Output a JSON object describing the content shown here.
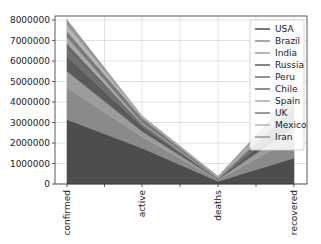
{
  "chart_data": {
    "type": "area",
    "stacked": true,
    "title": "",
    "xlabel": "",
    "ylabel": "",
    "categories": [
      "confirmed",
      "active",
      "deaths",
      "recovered"
    ],
    "ylim": [
      0,
      8300000
    ],
    "yticks": [
      0,
      1000000,
      2000000,
      3000000,
      4000000,
      5000000,
      6000000,
      7000000,
      8000000
    ],
    "ytick_labels": [
      "0",
      "1000000",
      "2000000",
      "3000000",
      "4000000",
      "5000000",
      "6000000",
      "7000000",
      "8000000"
    ],
    "grid": true,
    "legend_position": "upper right",
    "series": [
      {
        "name": "USA",
        "values": [
          3150000,
          1750000,
          134000,
          1270000
        ],
        "color": "#4d4d4d"
      },
      {
        "name": "Brazil",
        "values": [
          1550000,
          550000,
          64000,
          990000
        ],
        "color": "#8a8a8a"
      },
      {
        "name": "India",
        "values": [
          800000,
          270000,
          22000,
          500000
        ],
        "color": "#9c9c9c"
      },
      {
        "name": "Russia",
        "values": [
          720000,
          230000,
          11000,
          500000
        ],
        "color": "#5a5a5a"
      },
      {
        "name": "Peru",
        "values": [
          330000,
          110000,
          12000,
          220000
        ],
        "color": "#6e6e6e"
      },
      {
        "name": "Chile",
        "values": [
          310000,
          20000,
          7000,
          280000
        ],
        "color": "#666666"
      },
      {
        "name": "Spain",
        "values": [
          300000,
          60000,
          28000,
          190000
        ],
        "color": "#a8a8a8"
      },
      {
        "name": "UK",
        "values": [
          290000,
          240000,
          45000,
          1400
        ],
        "color": "#7a7a7a"
      },
      {
        "name": "Mexico",
        "values": [
          300000,
          70000,
          35000,
          190000
        ],
        "color": "#b5b5b5"
      },
      {
        "name": "Iran",
        "values": [
          260000,
          20000,
          13000,
          220000
        ],
        "color": "#959595"
      }
    ]
  },
  "legend": {
    "items": [
      "USA",
      "Brazil",
      "India",
      "Russia",
      "Peru",
      "Chile",
      "Spain",
      "UK",
      "Mexico",
      "Iran"
    ]
  }
}
